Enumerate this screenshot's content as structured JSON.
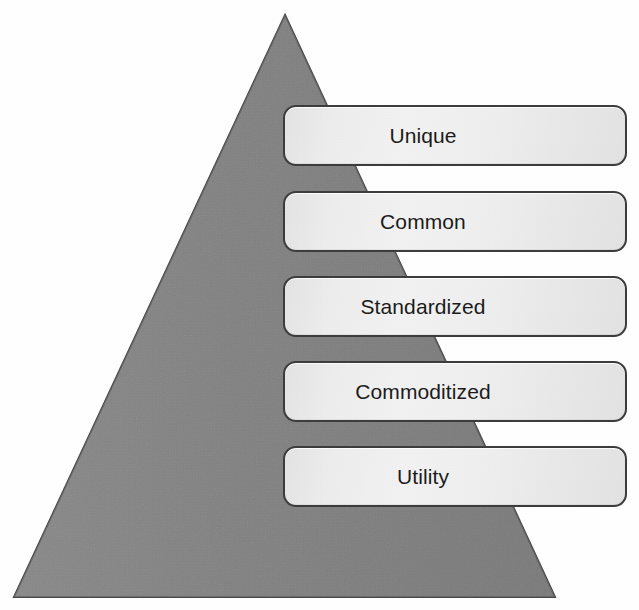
{
  "figure": {
    "kind": "pyramid-diagram",
    "background_color": "#ffffff",
    "pyramid": {
      "name": "evolution-pyramid",
      "fill_color": "#808080",
      "stroke_color": "#4a4a4a",
      "apex": {
        "x": 285,
        "y": 15
      },
      "base_left": {
        "x": 14,
        "y": 597
      },
      "base_right": {
        "x": 555,
        "y": 597
      }
    },
    "box_style": {
      "fill_color": "#eeeeee",
      "border_color": "#3d3d3d",
      "text_color": "#1c1c1c",
      "corner_radius": 13
    },
    "tiers": [
      {
        "label": "Unique",
        "x": 283,
        "y": 105,
        "width": 344,
        "height": 61
      },
      {
        "label": "Common",
        "x": 283,
        "y": 191,
        "width": 344,
        "height": 61
      },
      {
        "label": "Standardized",
        "x": 283,
        "y": 276,
        "width": 344,
        "height": 61
      },
      {
        "label": "Commoditized",
        "x": 283,
        "y": 361,
        "width": 344,
        "height": 61
      },
      {
        "label": "Utility",
        "x": 283,
        "y": 446,
        "width": 344,
        "height": 61
      }
    ]
  },
  "chart_data": {
    "type": "pyramid",
    "title": "",
    "categories": [
      "Unique",
      "Common",
      "Standardized",
      "Commoditized",
      "Utility"
    ],
    "values": [
      1,
      2,
      3,
      4,
      5
    ],
    "order": "top-to-bottom",
    "xlabel": "",
    "ylabel": ""
  }
}
